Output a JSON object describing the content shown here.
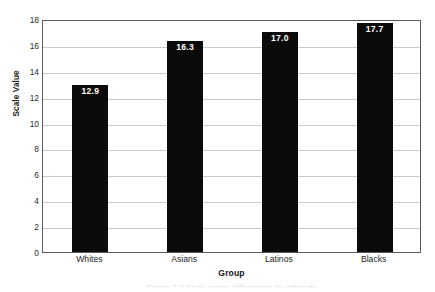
{
  "chart_data": {
    "type": "bar",
    "title": "",
    "categories": [
      "Whites",
      "Asians",
      "Latinos",
      "Blacks"
    ],
    "values": [
      12.9,
      16.3,
      17.0,
      17.7
    ],
    "value_labels": [
      "12.9",
      "16.3",
      "17.0",
      "17.7"
    ],
    "xlabel": "Group",
    "ylabel": "Scale Value",
    "ylim": [
      0,
      18
    ],
    "ytick_step": 2,
    "yticks": [
      0,
      2,
      4,
      6,
      8,
      10,
      12,
      14,
      16,
      18
    ],
    "ytick_labels": [
      "0",
      "2",
      "4",
      "6",
      "8",
      "10",
      "12",
      "14",
      "16",
      "18"
    ],
    "grid": "horizontal",
    "legend": "none",
    "bar_color": "#0b0b0b",
    "value_label_color": "#ffffff",
    "gridline_color": "#c9c9c9",
    "axis_border_color": "#5b5b5b",
    "background_color": "#ffffff"
  },
  "caption": {
    "text": "Figure 2.2  Scale score differences by ethnicity"
  }
}
